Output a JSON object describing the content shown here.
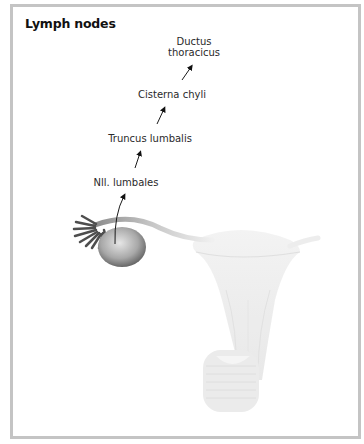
{
  "figure": {
    "title": "Lymph nodes",
    "labels": {
      "ductus_line1": "Ductus",
      "ductus_line2": "thoracicus",
      "cisterna": "Cisterna chyli",
      "truncus": "Truncus lumbalis",
      "nodes": "Nll. lumbales"
    },
    "flow_order": [
      "Nll. lumbales",
      "Truncus lumbalis",
      "Cisterna chyli",
      "Ductus thoracicus"
    ],
    "illustration": {
      "organs": [
        "ovary",
        "uterine tube",
        "uterus (faded)"
      ],
      "arrow_origin": "ovary"
    },
    "colors": {
      "frame": "#c4c4c4",
      "text": "#2a2a2a",
      "ovary": "#8a8a8a",
      "uterus": "#ececec"
    }
  }
}
